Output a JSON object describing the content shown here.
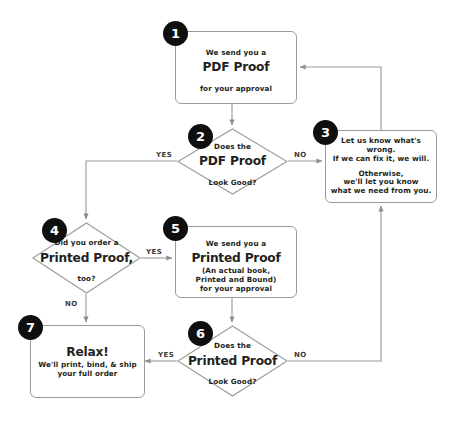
{
  "diagram": {
    "line_color": "#9b9b9b",
    "badge_color": "#0f0f0f",
    "text_color": "#231f20",
    "background": "#ffffff"
  },
  "nodes": {
    "n1": {
      "badge": "1",
      "shape": "process",
      "line1": "We send you a",
      "line2": "PDF Proof",
      "line3": "for your approval"
    },
    "n2": {
      "badge": "2",
      "shape": "decision",
      "line1": "Does the",
      "line2": "PDF Proof",
      "line3": "Look Good?"
    },
    "n3": {
      "badge": "3",
      "shape": "process",
      "line1": "Let us know what's wrong.",
      "line2": "If we can fix it, we will.",
      "line3": "Otherwise,",
      "line4": "we'll let you know",
      "line5": "what we need from you."
    },
    "n4": {
      "badge": "4",
      "shape": "decision",
      "line1": "Did you order a",
      "line2": "Printed Proof,",
      "line3": "too?"
    },
    "n5": {
      "badge": "5",
      "shape": "process",
      "line1": "We send you a",
      "line2": "Printed Proof",
      "line3": "(An actual book,",
      "line4": "Printed and Bound)",
      "line5": "for your approval"
    },
    "n6": {
      "badge": "6",
      "shape": "decision",
      "line1": "Does the",
      "line2": "Printed Proof",
      "line3": "Look Good?"
    },
    "n7": {
      "badge": "7",
      "shape": "process",
      "line1": "Relax!",
      "line2": "We'll print, bind, & ship",
      "line3": "your full order"
    }
  },
  "edge_labels": {
    "e2_yes": "YES",
    "e2_no": "NO",
    "e4_yes": "YES",
    "e4_no": "NO",
    "e6_yes": "YES",
    "e6_no": "NO"
  }
}
